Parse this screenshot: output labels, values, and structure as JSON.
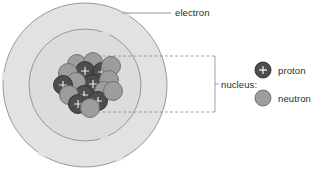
{
  "diagram": {
    "labels": {
      "electron": "electron",
      "nucleus": "nucleus:",
      "proton": "proton",
      "neutron": "neutron"
    },
    "colors": {
      "shell_fill": "#e2e2e2",
      "shell_inner_fill": "#dcdcdc",
      "shell_stroke": "#8f8f8f",
      "proton_fill": "#4d4d4d",
      "proton_stroke": "#2e2e2e",
      "neutron_fill": "#9d9d9d",
      "neutron_stroke": "#6a6a6a",
      "leader_line": "#7a7a7a",
      "bracket_line": "#8a8a8a",
      "text": "#2b2b2b",
      "background": "#ffffff"
    },
    "geometry": {
      "outer_shell_center_x": 85,
      "outer_shell_center_y": 85,
      "outer_shell_radius": 82,
      "inner_shell_radius": 56,
      "nucleus_center_x": 86,
      "nucleus_center_y": 85,
      "particle_radius": 9.5
    },
    "electron_leader": {
      "x1": 122,
      "y1": 13,
      "x2": 171,
      "y2": 13
    },
    "nucleus_bracket": {
      "top_y": 56,
      "bottom_y": 112,
      "left_x": 92,
      "right_x": 215,
      "tick_x": 219,
      "tick_y": 84
    },
    "legend": {
      "proton_marker": {
        "cx": 263,
        "cy": 70,
        "r": 8
      },
      "neutron_marker": {
        "cx": 263,
        "cy": 98,
        "r": 8
      }
    },
    "nucleus_particles": [
      {
        "type": "neutron",
        "cx": 77,
        "cy": 64
      },
      {
        "type": "neutron",
        "cx": 93,
        "cy": 62
      },
      {
        "type": "proton",
        "cx": 85,
        "cy": 71
      },
      {
        "type": "proton",
        "cx": 102,
        "cy": 72
      },
      {
        "type": "neutron",
        "cx": 68,
        "cy": 73
      },
      {
        "type": "neutron",
        "cx": 111,
        "cy": 66
      },
      {
        "type": "proton",
        "cx": 93,
        "cy": 84
      },
      {
        "type": "neutron",
        "cx": 76,
        "cy": 82
      },
      {
        "type": "neutron",
        "cx": 109,
        "cy": 80
      },
      {
        "type": "proton",
        "cx": 63,
        "cy": 85
      },
      {
        "type": "neutron",
        "cx": 104,
        "cy": 91
      },
      {
        "type": "proton",
        "cx": 84,
        "cy": 95
      },
      {
        "type": "neutron",
        "cx": 69,
        "cy": 95
      },
      {
        "type": "proton",
        "cx": 98,
        "cy": 101
      },
      {
        "type": "neutron",
        "cx": 113,
        "cy": 91
      },
      {
        "type": "proton",
        "cx": 78,
        "cy": 104
      },
      {
        "type": "neutron",
        "cx": 90,
        "cy": 108
      }
    ],
    "shell_gaps": [
      {
        "shell": "outer",
        "angle": 300
      },
      {
        "shell": "outer",
        "angle": 186
      },
      {
        "shell": "outer",
        "angle": 122
      },
      {
        "shell": "outer",
        "angle": 65
      },
      {
        "shell": "inner",
        "angle": 292
      },
      {
        "shell": "inner",
        "angle": 70
      }
    ]
  }
}
